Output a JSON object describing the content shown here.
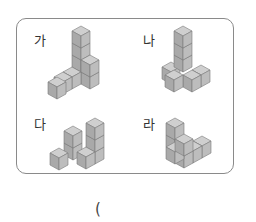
{
  "figures": [
    {
      "label": "가"
    },
    {
      "label": "나"
    },
    {
      "label": "다"
    },
    {
      "label": "라"
    }
  ],
  "answer": {
    "open_paren": "("
  },
  "colors": {
    "top": "#cfcfcf",
    "left": "#a9a9a9",
    "right": "#bdbdbd",
    "edge": "#7a7a7a",
    "border": "#8a8a8a"
  }
}
